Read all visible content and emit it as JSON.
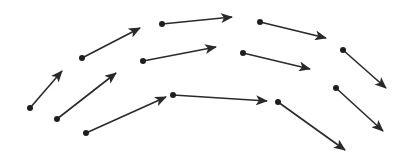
{
  "diagram": {
    "type": "vector-field",
    "stroke_color": "#2a2a2a",
    "dot_color": "#1e1e1e",
    "arrows": [
      {
        "id": "a1",
        "x1": 30,
        "y1": 108,
        "x2": 62,
        "y2": 71
      },
      {
        "id": "a2",
        "x1": 57,
        "y1": 119,
        "x2": 116,
        "y2": 73
      },
      {
        "id": "a3",
        "x1": 86,
        "y1": 133,
        "x2": 166,
        "y2": 97
      },
      {
        "id": "a4",
        "x1": 82,
        "y1": 58,
        "x2": 140,
        "y2": 28
      },
      {
        "id": "a5",
        "x1": 143,
        "y1": 61,
        "x2": 216,
        "y2": 47
      },
      {
        "id": "a6",
        "x1": 173,
        "y1": 95,
        "x2": 267,
        "y2": 101
      },
      {
        "id": "a7",
        "x1": 162,
        "y1": 24,
        "x2": 232,
        "y2": 17
      },
      {
        "id": "a8",
        "x1": 260,
        "y1": 22,
        "x2": 326,
        "y2": 38
      },
      {
        "id": "a9",
        "x1": 243,
        "y1": 53,
        "x2": 310,
        "y2": 69
      },
      {
        "id": "a10",
        "x1": 278,
        "y1": 102,
        "x2": 345,
        "y2": 150
      },
      {
        "id": "a11",
        "x1": 343,
        "y1": 50,
        "x2": 386,
        "y2": 88
      },
      {
        "id": "a12",
        "x1": 336,
        "y1": 88,
        "x2": 383,
        "y2": 131
      }
    ]
  }
}
